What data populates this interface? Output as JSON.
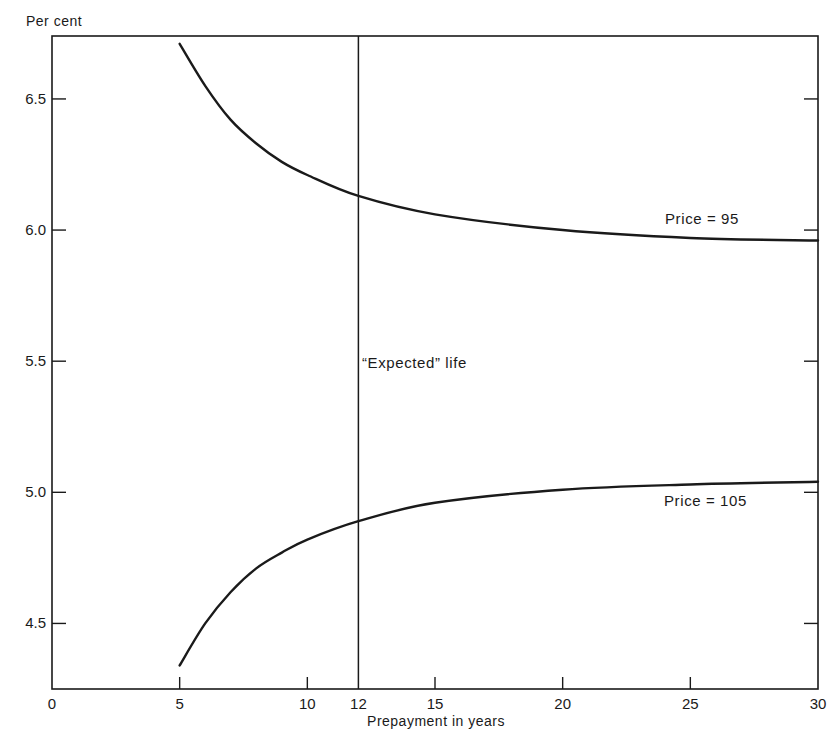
{
  "chart_data": {
    "type": "line",
    "title": "",
    "xlabel": "Prepayment in years",
    "ylabel": "Per cent",
    "xlim": [
      0,
      30
    ],
    "ylim": [
      4.25,
      6.74
    ],
    "grid": false,
    "x_ticks": [
      0,
      5,
      10,
      12,
      15,
      20,
      25,
      30
    ],
    "x_tick_labels": [
      "0",
      "5",
      "10",
      "12",
      "15",
      "20",
      "25",
      "30"
    ],
    "y_ticks": [
      4.5,
      5.0,
      5.5,
      6.0,
      6.5
    ],
    "y_tick_labels": [
      "4.5",
      "5.0",
      "5.5",
      "6.0",
      "6.5"
    ],
    "series": [
      {
        "name": "Price = 95",
        "label": "Price = 95",
        "x": [
          5,
          6,
          7,
          8,
          9,
          10,
          12,
          15,
          20,
          25,
          30
        ],
        "values": [
          6.71,
          6.55,
          6.42,
          6.33,
          6.26,
          6.21,
          6.13,
          6.06,
          6.0,
          5.97,
          5.96
        ]
      },
      {
        "name": "Price = 105",
        "label": "Price = 105",
        "x": [
          5,
          6,
          7,
          8,
          9,
          10,
          12,
          15,
          20,
          25,
          30
        ],
        "values": [
          4.34,
          4.5,
          4.62,
          4.71,
          4.77,
          4.82,
          4.89,
          4.96,
          5.01,
          5.03,
          5.04
        ]
      }
    ],
    "annotations": [
      {
        "type": "vline",
        "x": 12,
        "label": "“Expected” life"
      }
    ]
  },
  "labels": {
    "ylabel": "Per cent",
    "xlabel": "Prepayment in years",
    "series_95": "Price = 95",
    "series_105": "Price = 105",
    "vline": "“Expected” life"
  },
  "colors": {
    "ink": "#1a1a1a",
    "background": "#ffffff"
  }
}
